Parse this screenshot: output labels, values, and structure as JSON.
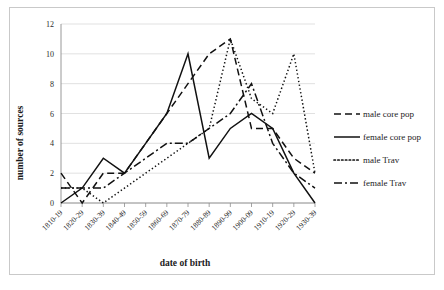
{
  "chart_data": {
    "type": "line",
    "title": "",
    "xlabel": "date of birth",
    "ylabel": "number of sources",
    "grid": true,
    "legend_position": "right",
    "xlim_categories": true,
    "ylim": [
      0,
      12
    ],
    "ytick_step": 2,
    "yticks": [
      "0",
      "2",
      "4",
      "6",
      "8",
      "10",
      "12"
    ],
    "categories": [
      "1810-19",
      "1820-29",
      "1830-39",
      "1840-49",
      "1850-59",
      "1860-69",
      "1870-79",
      "1880-89",
      "1890-99",
      "1900-09",
      "1910-19",
      "1920-29",
      "1930-39"
    ],
    "series": [
      {
        "name": "male core pop",
        "style": "dashed",
        "values": [
          2,
          0,
          2,
          2,
          4,
          6,
          8,
          10,
          11,
          5,
          5,
          3,
          2
        ]
      },
      {
        "name": "female core pop",
        "style": "solid",
        "values": [
          0,
          1,
          3,
          2,
          4,
          6,
          10,
          3,
          5,
          6,
          5,
          2,
          0
        ]
      },
      {
        "name": "male Trav",
        "style": "dotted",
        "values": [
          1,
          1,
          0,
          1,
          2,
          3,
          4,
          5,
          11,
          7,
          6,
          10,
          2
        ]
      },
      {
        "name": "female Trav",
        "style": "dashdot",
        "values": [
          1,
          1,
          1,
          2,
          3,
          4,
          4,
          5,
          6,
          8,
          4,
          2,
          1
        ]
      }
    ]
  },
  "legend": {
    "items": [
      {
        "label": "male core pop",
        "style": "dashed"
      },
      {
        "label": "female core pop",
        "style": "solid"
      },
      {
        "label": "male Trav",
        "style": "dotted"
      },
      {
        "label": "female Trav",
        "style": "dashdot"
      }
    ]
  },
  "colors": {
    "line": "#111111",
    "grid": "#d9d9d9",
    "axis": "#8d8d8d",
    "frame": "#c9c9c9",
    "background": "#ffffff",
    "text": "#1b1b1b"
  }
}
